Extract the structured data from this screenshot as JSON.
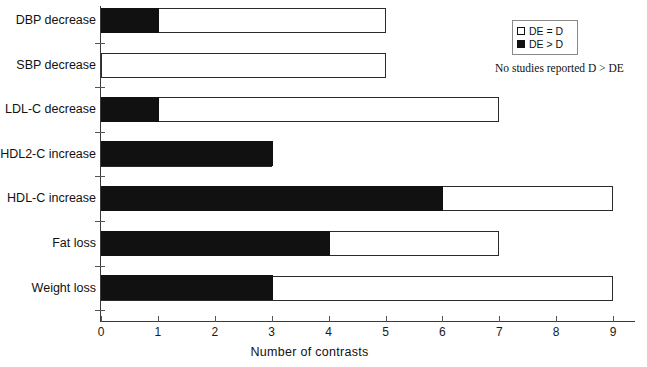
{
  "chart_data": {
    "type": "bar",
    "orientation": "horizontal",
    "stacked": true,
    "title": "",
    "xlabel": "Number of contrasts",
    "ylabel": "",
    "xlim": [
      0,
      9
    ],
    "xticks": [
      0,
      1,
      2,
      3,
      4,
      5,
      6,
      7,
      8,
      9
    ],
    "xticklabels": [
      "0",
      "1",
      "2",
      "3",
      "4",
      "5",
      "6",
      "7",
      "8",
      "9"
    ],
    "grid": false,
    "legend_position": "top-right",
    "categories": [
      "DBP decrease",
      "SBP decrease",
      "LDL-C decrease",
      "HDL2-C increase",
      "HDL-C increase",
      "Fat loss",
      "Weight loss"
    ],
    "series": [
      {
        "name": "DE > D",
        "color": "#111111",
        "values": [
          1,
          0,
          1,
          3,
          6,
          4,
          3
        ]
      },
      {
        "name": "DE = D",
        "color": "#ffffff",
        "values": [
          4,
          5,
          6,
          0,
          3,
          3,
          6
        ]
      }
    ],
    "totals": [
      5,
      5,
      7,
      3,
      9,
      7,
      9
    ],
    "annotations": [
      "No studies reported D > DE"
    ]
  },
  "legend": {
    "entries": [
      {
        "label": "DE = D",
        "swatch": "empty"
      },
      {
        "label": "DE > D",
        "swatch": "filled"
      }
    ]
  },
  "note": "No studies reported D > DE",
  "axis": {
    "x_title": "Number of contrasts"
  }
}
